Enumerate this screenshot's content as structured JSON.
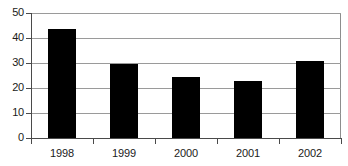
{
  "chart_data": {
    "type": "bar",
    "title": "",
    "subtitle": "",
    "xlabel": "",
    "ylabel": "",
    "categories": [
      "1998",
      "1999",
      "2000",
      "2001",
      "2002"
    ],
    "values": [
      43.5,
      29.7,
      24.5,
      23.0,
      31.0
    ],
    "series": [
      {
        "name": "",
        "values": [
          43.5,
          29.7,
          24.5,
          23.0,
          31.0
        ],
        "color": "#000000"
      }
    ],
    "ylim": [
      0,
      50
    ],
    "xlim": null,
    "y_ticks": [
      0,
      10,
      20,
      30,
      40,
      50
    ],
    "y_tick_labels": [
      "0",
      "10",
      "20",
      "30",
      "40",
      "50"
    ],
    "x_tick_labels": [
      "1998",
      "1999",
      "2000",
      "2001",
      "2002"
    ],
    "grid": true,
    "grid_axis": "y",
    "legend": false,
    "legend_position": "none",
    "annotations": [],
    "colors": {
      "bar": "#000000",
      "gridline": "#9a9a9a",
      "axis": "#4a4a4a",
      "background": "#ffffff",
      "text": "#1a1a1a"
    }
  }
}
